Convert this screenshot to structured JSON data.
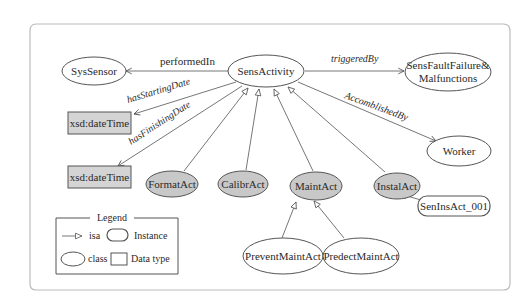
{
  "diagram": {
    "nodes": {
      "sys_sensor": {
        "label": "SysSensor",
        "kind": "class"
      },
      "sens_activity": {
        "label": "SensActivity",
        "kind": "class"
      },
      "sens_fault": {
        "label_line1": "SensFaultFailure&",
        "label_line2": "Malfunctions",
        "kind": "class"
      },
      "datetime_1": {
        "label": "xsd:dateTime",
        "kind": "datatype"
      },
      "datetime_2": {
        "label": "xsd:dateTime",
        "kind": "datatype"
      },
      "worker": {
        "label": "Worker",
        "kind": "class"
      },
      "format_act": {
        "label": "FormatAct",
        "kind": "class-subclass"
      },
      "calibr_act": {
        "label": "CalibrAct",
        "kind": "class-subclass"
      },
      "maint_act": {
        "label": "MaintAct",
        "kind": "class-subclass"
      },
      "instal_act": {
        "label": "InstalAct",
        "kind": "class-subclass"
      },
      "sen_ins_act_001": {
        "label": "SenInsAct_001",
        "kind": "instance"
      },
      "prevent_maint_act": {
        "label": "PreventMaintAct",
        "kind": "class"
      },
      "predect_maint_act": {
        "label": "PredectMaintAct",
        "kind": "class"
      }
    },
    "edges": {
      "performed_in": {
        "label": "performedIn",
        "from": "SensActivity",
        "to": "SysSensor"
      },
      "triggered_by": {
        "label": "triggeredBy",
        "from": "SensActivity",
        "to": "SensFaultFailure&Malfunctions"
      },
      "has_starting_date": {
        "label": "hasStartingDate",
        "from": "SensActivity",
        "to": "xsd:dateTime"
      },
      "has_finishing_date": {
        "label": "hasFinishingDate",
        "from": "SensActivity",
        "to": "xsd:dateTime"
      },
      "accomblished_by": {
        "label": "AccomblishedBy",
        "from": "SensActivity",
        "to": "Worker"
      }
    },
    "isa_relations": [
      {
        "child": "FormatAct",
        "parent": "SensActivity"
      },
      {
        "child": "CalibrAct",
        "parent": "SensActivity"
      },
      {
        "child": "MaintAct",
        "parent": "SensActivity"
      },
      {
        "child": "InstalAct",
        "parent": "SensActivity"
      },
      {
        "child": "PreventMaintAct",
        "parent": "MaintAct"
      },
      {
        "child": "PredectMaintAct",
        "parent": "MaintAct"
      },
      {
        "child": "SenInsAct_001",
        "parent": "InstalAct"
      }
    ],
    "legend": {
      "title": "Legend",
      "isa": "isa",
      "instance": "Instance",
      "class": "class",
      "data_type": "Data type"
    },
    "colors": {
      "subclass_fill": "#c8c8c8",
      "datatype_fill": "#d4d4d4",
      "stroke": "#555555",
      "frame": "#bbbbbb"
    }
  }
}
